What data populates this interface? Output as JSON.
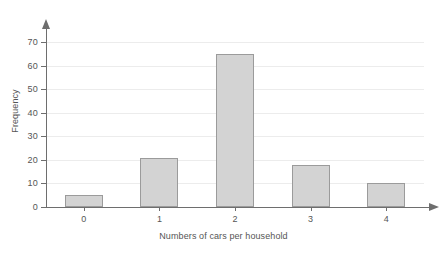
{
  "chart_data": {
    "type": "bar",
    "title": "",
    "subtitle": "",
    "xlabel": "Numbers of cars per household",
    "ylabel": "Frequency",
    "categories": [
      "0",
      "1",
      "2",
      "3",
      "4"
    ],
    "values": [
      5,
      21,
      65,
      18,
      10
    ],
    "series": [
      {
        "name": "Frequency",
        "values": [
          5,
          21,
          65,
          18,
          10
        ]
      }
    ],
    "ylim": [
      0,
      70
    ],
    "y_ticks": [
      0,
      10,
      20,
      30,
      40,
      50,
      60,
      70
    ],
    "y_tick_labels": [
      "0",
      "10",
      "20",
      "30",
      "40",
      "50",
      "60",
      "70"
    ],
    "x_tick_labels": [
      "0",
      "1",
      "2",
      "3",
      "4"
    ],
    "grid": true,
    "grid_axis": "y",
    "legend": false,
    "legend_position": "none",
    "annotations": [],
    "colors": {
      "bar_fill": "#d3d3d3",
      "bar_border": "#9b9b9b",
      "gridline": "#ececec",
      "axis": "#6e6e6e",
      "text": "#555555",
      "background": "#ffffff"
    },
    "axis_arrows": {
      "x": true,
      "y": true
    }
  }
}
